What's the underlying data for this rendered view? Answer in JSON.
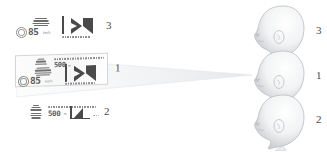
{
  "figure": {
    "background_color": "#ffffff",
    "ink_color": "#4b4b4b"
  },
  "panels": [
    {
      "id": "panel-top",
      "index_label": "3",
      "framed": false,
      "roundel_icon": "circular-roundel-icon",
      "gantry_icon": "overhead-gantry-icon",
      "speed_value": "85",
      "speed_unit": "km/h",
      "header_text": "",
      "chart_icon": "bar-chart-glyph-icon",
      "caption_text": "",
      "has_roundel": true,
      "has_header": false
    },
    {
      "id": "panel-middle",
      "index_label": "1",
      "framed": true,
      "roundel_icon": "circular-roundel-icon",
      "gantry_icon": "overhead-gantry-icon",
      "speed_value": "85",
      "speed_unit": "km/h",
      "header_text": "500",
      "header_unit": "m",
      "chart_icon": "bar-chart-glyph-icon",
      "caption_text": "",
      "has_roundel": true,
      "has_header": true
    },
    {
      "id": "panel-bottom",
      "index_label": "2",
      "framed": false,
      "roundel_icon": "",
      "gantry_icon": "overhead-gantry-icon",
      "speed_value": "500",
      "speed_unit": "m",
      "header_text": "",
      "chart_icon": "bar-chart-glyph-icon",
      "caption_text": "",
      "has_roundel": false,
      "has_header": false
    }
  ],
  "heads": [
    {
      "id": "head-top",
      "index_label": "3",
      "icon": "head-profile-icon"
    },
    {
      "id": "head-middle",
      "index_label": "1",
      "icon": "head-profile-icon"
    },
    {
      "id": "head-bottom",
      "index_label": "2",
      "icon": "head-profile-icon"
    }
  ],
  "cone": {
    "icon": "view-cone-icon",
    "color": "#eceef0"
  }
}
